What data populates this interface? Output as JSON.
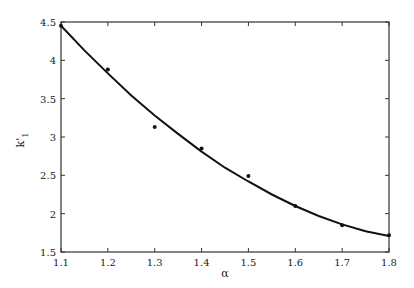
{
  "chart_data": {
    "type": "scatter",
    "title": "",
    "xlabel": "α",
    "ylabel": "k'₁",
    "xlim": [
      1.1,
      1.8
    ],
    "ylim": [
      1.5,
      4.5
    ],
    "xticks": [
      "1.1",
      "1.2",
      "1.3",
      "1.4",
      "1.5",
      "1.6",
      "1.7",
      "1.8"
    ],
    "yticks": [
      "1.5",
      "2",
      "2.5",
      "3",
      "3.5",
      "4",
      "4.5"
    ],
    "grid": false,
    "legend": null,
    "series": [
      {
        "name": "data points",
        "type": "scatter",
        "x": [
          1.1,
          1.2,
          1.3,
          1.4,
          1.5,
          1.6,
          1.7,
          1.8
        ],
        "y": [
          4.45,
          3.88,
          3.13,
          2.85,
          2.49,
          2.1,
          1.85,
          1.72
        ]
      },
      {
        "name": "fitted curve",
        "type": "line",
        "x": [
          1.1,
          1.15,
          1.2,
          1.25,
          1.3,
          1.35,
          1.4,
          1.45,
          1.5,
          1.55,
          1.6,
          1.65,
          1.7,
          1.75,
          1.8
        ],
        "y": [
          4.45,
          4.13,
          3.83,
          3.54,
          3.28,
          3.04,
          2.81,
          2.6,
          2.42,
          2.25,
          2.1,
          1.97,
          1.86,
          1.77,
          1.71
        ]
      }
    ]
  },
  "labels": {
    "xlabel": "α",
    "ylabel_main": "k'",
    "ylabel_sub": "1"
  }
}
